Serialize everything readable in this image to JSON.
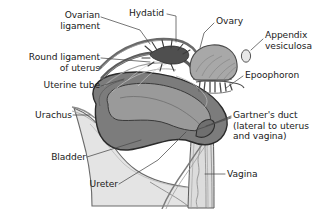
{
  "figure": {
    "background_color": "#ffffff",
    "text_color": "#1a1a1a",
    "leader_line_color": "#4a4a4a",
    "palette": {
      "uterus_wall": "#7c7c7c",
      "uterus_cavity": "#9a9a9a",
      "uterus_outline": "#2b2b2b",
      "tube_dark": "#5c5c5c",
      "bladder_fill": "#e4e4e4",
      "bladder_outline": "#6a6a6a",
      "ovary_fill": "#a8a8a8",
      "vagina_fill": "#dcdcdc",
      "fimbriae_dark": "#4f4f4f"
    },
    "labels": [
      {
        "id": "ovarian-ligament",
        "text": "Ovarian\nligament",
        "align": "right",
        "x": 14,
        "y": 10,
        "width": 86
      },
      {
        "id": "hydatid",
        "text": "Hydatid",
        "align": "left",
        "x": 129,
        "y": 8,
        "width": 50
      },
      {
        "id": "ovary",
        "text": "Ovary",
        "align": "left",
        "x": 216,
        "y": 16,
        "width": 40
      },
      {
        "id": "appendix-vesiculosa",
        "text": "Appendix\nvesiculosa",
        "align": "left",
        "x": 265,
        "y": 30,
        "width": 58
      },
      {
        "id": "round-ligament-of-uterus",
        "text": "Round ligament\nof uterus",
        "align": "right",
        "x": 4,
        "y": 52,
        "width": 96
      },
      {
        "id": "epoophoron",
        "text": "Epoophoron",
        "align": "left",
        "x": 245,
        "y": 70,
        "width": 70
      },
      {
        "id": "uterine-tube",
        "text": "Uterine tube",
        "align": "right",
        "x": 14,
        "y": 80,
        "width": 86
      },
      {
        "id": "urachus",
        "text": "Urachus",
        "align": "right",
        "x": 14,
        "y": 110,
        "width": 58
      },
      {
        "id": "gartners-duct",
        "text": "Gartner's duct\n(lateral to uterus\nand vagina)",
        "align": "left",
        "x": 233,
        "y": 110,
        "width": 88
      },
      {
        "id": "bladder",
        "text": "Bladder",
        "align": "right",
        "x": 30,
        "y": 152,
        "width": 56
      },
      {
        "id": "ureter",
        "text": "Ureter",
        "align": "right",
        "x": 70,
        "y": 179,
        "width": 48
      },
      {
        "id": "vagina",
        "text": "Vagina",
        "align": "left",
        "x": 227,
        "y": 169,
        "width": 46
      }
    ],
    "structures": [
      {
        "id": "uterus",
        "name": "uterus-body"
      },
      {
        "id": "uterine-cavity",
        "name": "uterine-cavity"
      },
      {
        "id": "bladder",
        "name": "bladder"
      },
      {
        "id": "vagina",
        "name": "vagina"
      },
      {
        "id": "ovary",
        "name": "ovary"
      },
      {
        "id": "epoophoron",
        "name": "epoophoron"
      },
      {
        "id": "uterine-tube",
        "name": "uterine-tube"
      },
      {
        "id": "ovarian-ligament",
        "name": "ovarian-ligament"
      },
      {
        "id": "round-ligament",
        "name": "round-ligament-of-uterus"
      },
      {
        "id": "urachus",
        "name": "urachus"
      },
      {
        "id": "ureter",
        "name": "ureter"
      },
      {
        "id": "gartners-duct",
        "name": "gartners-duct"
      },
      {
        "id": "appendix-vesiculosa",
        "name": "appendix-vesiculosa"
      },
      {
        "id": "fimbriae",
        "name": "fimbriae"
      }
    ]
  }
}
